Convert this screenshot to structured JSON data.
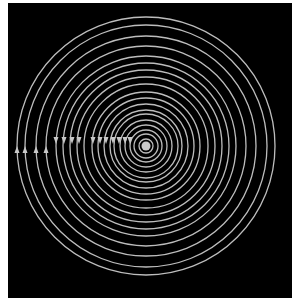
{
  "figure": {
    "background": "#000000",
    "ring_color": "#bdbdbd",
    "center": {
      "x": 146,
      "y": 146,
      "dot_radius": 4.5
    },
    "ring_radii": [
      7,
      12,
      16,
      21,
      26,
      32,
      36,
      42,
      48,
      54,
      62,
      69,
      76,
      83,
      90,
      100,
      110,
      121,
      129
    ],
    "arrows_up": [
      17,
      25,
      36,
      46
    ],
    "arrows_down": [
      56,
      64,
      72,
      79,
      93,
      100,
      106,
      113,
      119,
      125,
      130
    ],
    "arrow_up_y": 150,
    "arrow_down_y": 140
  }
}
